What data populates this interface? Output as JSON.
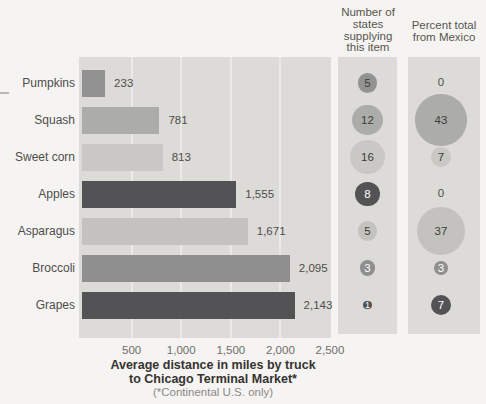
{
  "page": {
    "background": "#f5f4f2",
    "band_background": "#dcdbd8",
    "gridline_color": "#eceae7",
    "bubble_text_dark": "#3f3d3a",
    "bubble_text_light": "#ffffff"
  },
  "headers": {
    "states_lines": [
      "Number of",
      "states",
      "supplying",
      "this item"
    ],
    "mexico_lines": [
      "Percent total",
      "from Mexico"
    ]
  },
  "axis": {
    "ticks": [
      "500",
      "1,000",
      "1,500",
      "2,000",
      "2,500"
    ],
    "max_miles": 2500
  },
  "title": {
    "line1": "Average distance in miles by truck",
    "line2": "to Chicago Terminal Market*",
    "footnote": "(*Continental U.S. only)"
  },
  "rows": [
    {
      "label": "Pumpkins",
      "miles": 233,
      "miles_label": "233",
      "states": 5,
      "pct_mexico": 0,
      "color": "#929292",
      "bubble_text": "dark"
    },
    {
      "label": "Squash",
      "miles": 781,
      "miles_label": "781",
      "states": 12,
      "pct_mexico": 43,
      "color": "#acacaa",
      "bubble_text": "dark"
    },
    {
      "label": "Sweet corn",
      "miles": 813,
      "miles_label": "813",
      "states": 16,
      "pct_mexico": 7,
      "color": "#c9c8c5",
      "bubble_text": "dark"
    },
    {
      "label": "Apples",
      "miles": 1555,
      "miles_label": "1,555",
      "states": 8,
      "pct_mexico": 0,
      "color": "#535355",
      "bubble_text": "light"
    },
    {
      "label": "Asparagus",
      "miles": 1671,
      "miles_label": "1,671",
      "states": 5,
      "pct_mexico": 37,
      "color": "#c3c2bf",
      "bubble_text": "dark"
    },
    {
      "label": "Broccoli",
      "miles": 2095,
      "miles_label": "2,095",
      "states": 3,
      "pct_mexico": 3,
      "color": "#8f8f8f",
      "bubble_text": "light"
    },
    {
      "label": "Grapes",
      "miles": 2143,
      "miles_label": "2,143",
      "states": 1,
      "pct_mexico": 7,
      "color": "#535355",
      "bubble_text": "light"
    }
  ],
  "chart_data": {
    "type": "bar",
    "orientation": "horizontal",
    "categories": [
      "Pumpkins",
      "Squash",
      "Sweet corn",
      "Apples",
      "Asparagus",
      "Broccoli",
      "Grapes"
    ],
    "series": [
      {
        "name": "Average distance in miles by truck to Chicago Terminal Market (Continental U.S. only)",
        "values": [
          233,
          781,
          813,
          1555,
          1671,
          2095,
          2143
        ]
      },
      {
        "name": "Number of states supplying this item",
        "values": [
          5,
          12,
          16,
          8,
          5,
          3,
          1
        ]
      },
      {
        "name": "Percent total from Mexico",
        "values": [
          0,
          43,
          7,
          0,
          37,
          3,
          7
        ]
      }
    ],
    "title": "Average distance in miles by truck to Chicago Terminal Market*",
    "footnote": "(*Continental U.S. only)",
    "xlabel": "miles",
    "xlim": [
      0,
      2500
    ],
    "x_ticks": [
      500,
      1000,
      1500,
      2000,
      2500
    ],
    "grid": true,
    "legend": false
  }
}
